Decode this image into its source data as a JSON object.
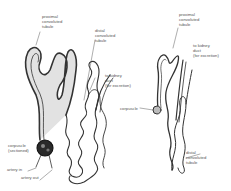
{
  "figure": {
    "left_nephron": {
      "labels": {
        "proximal": "proximal\nconvoluted\ntubule",
        "distal": "distal\nconvoluted\ntubule",
        "duct": "to kidney\nduct\n(for excretion)",
        "corpuscle": "corpuscle\n(sectioned)",
        "artery_in": "artery in",
        "artery_out": "artery out"
      }
    },
    "right_nephron": {
      "labels": {
        "proximal": "proximal\nconvoluted\ntubule",
        "duct": "to kidney\nduct\n(for excretion)",
        "corpuscle": "corpuscle",
        "distal": "distal\nconvoluted\ntubule"
      }
    },
    "colors": {
      "ink": "#333333",
      "label": "#555555",
      "fill": "#d8d8d8"
    }
  }
}
